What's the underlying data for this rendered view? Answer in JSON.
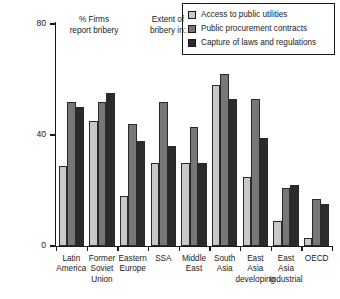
{
  "legend": {
    "items": [
      {
        "label": "Access to public utilities",
        "color": "#c9c9c9",
        "icon": "legend-swatch-icon"
      },
      {
        "label": "Public procurement contracts",
        "color": "#777777",
        "icon": "legend-swatch-icon"
      },
      {
        "label": "Capture of laws and regulations",
        "color": "#2b2b2b",
        "icon": "legend-swatch-icon"
      }
    ]
  },
  "annotations": {
    "left": "% Firms\nreport bribery",
    "left_line1": "% Firms",
    "left_line2": "report bribery",
    "right_line1": "Extent of",
    "right_line2": "bribery in:"
  },
  "axis": {
    "y_ticks": [
      "0",
      "40",
      "80"
    ],
    "y_min": 0,
    "y_max": 80
  },
  "chart_data": {
    "type": "bar",
    "title": "",
    "subtitle": "",
    "xlabel": "",
    "ylabel": "% Firms report bribery",
    "ylim": [
      0,
      80
    ],
    "yticks": [
      0,
      40,
      80
    ],
    "grid": false,
    "legend_position": "top-right",
    "annotations": [
      "% Firms report bribery",
      "Extent of bribery in:"
    ],
    "categories": [
      "Latin America",
      "Former Soviet Union",
      "Eastern Europe",
      "SSA",
      "Middle East",
      "South Asia",
      "East Asia developing",
      "East Asia Industrial",
      "OECD"
    ],
    "category_lines": [
      [
        "Latin",
        "America"
      ],
      [
        "Former",
        "Soviet",
        "Union"
      ],
      [
        "Eastern",
        "Europe"
      ],
      [
        "SSA"
      ],
      [
        "Middle",
        "East"
      ],
      [
        "South",
        "Asia"
      ],
      [
        "East",
        "Asia",
        "developing"
      ],
      [
        "East",
        "Asia",
        "Industrial"
      ],
      [
        "OECD"
      ]
    ],
    "series": [
      {
        "name": "Access to public utilities",
        "color": "#c9c9c9",
        "values": [
          29,
          45,
          18,
          30,
          30,
          58,
          25,
          9,
          3
        ]
      },
      {
        "name": "Public procurement contracts",
        "color": "#777777",
        "values": [
          52,
          52,
          44,
          52,
          43,
          62,
          53,
          21,
          17
        ]
      },
      {
        "name": "Capture of laws and regulations",
        "color": "#2b2b2b",
        "values": [
          50,
          55,
          38,
          36,
          30,
          53,
          39,
          22,
          15
        ]
      }
    ]
  }
}
